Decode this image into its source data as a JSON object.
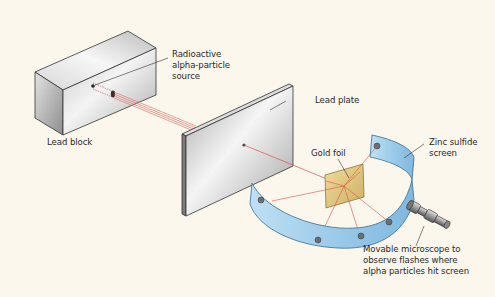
{
  "diagram": {
    "type": "Rutherford gold foil experiment apparatus",
    "labels": {
      "source": "Radioactive\nalpha-particle\nsource",
      "lead_block": "Lead block",
      "lead_plate": "Lead plate",
      "gold_foil": "Gold foil",
      "screen": "Zinc sulfide\nscreen",
      "microscope": "Movable microscope to\nobserve flashes where\nalpha particles hit screen"
    },
    "colors": {
      "background": "#fbf7ec",
      "lead_light": "#f2f2f2",
      "lead_dark": "#8d8d8d",
      "beam": "#d9534f",
      "gold": "#e6cf8a",
      "screen": "#a9d3ee",
      "screen_dark": "#6fa8d0",
      "spot": "#6b7078"
    }
  }
}
